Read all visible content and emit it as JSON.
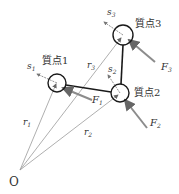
{
  "diagram": {
    "origin_label": "O",
    "particles": [
      {
        "name": "質点1",
        "position_label": "r",
        "position_sub": "1",
        "force_label": "F",
        "force_sub": "1",
        "spin_label": "s",
        "spin_sub": "1"
      },
      {
        "name": "質点2",
        "position_label": "r",
        "position_sub": "2",
        "force_label": "F",
        "force_sub": "2",
        "spin_label": "s",
        "spin_sub": "2"
      },
      {
        "name": "質点3",
        "position_label": "r",
        "position_sub": "3",
        "force_label": "F",
        "force_sub": "3",
        "spin_label": "s",
        "spin_sub": "3"
      }
    ],
    "colors": {
      "position_vector": "#9a9a9a",
      "force_arrow": "#8c8c8c",
      "rod": "#1a1a1a",
      "circle": "#1a1a1a",
      "spin_arrow": "#777777"
    }
  }
}
